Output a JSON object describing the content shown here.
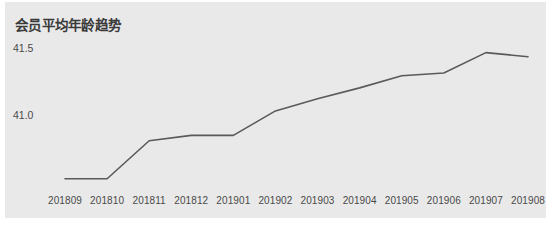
{
  "card": {
    "title": "会员平均年龄趋势",
    "background_color": "#e9e9e9",
    "page_background_color": "#ffffff"
  },
  "chart_data": {
    "type": "line",
    "title": "会员平均年龄趋势",
    "xlabel": "",
    "ylabel": "",
    "x": [
      "201809",
      "201810",
      "201811",
      "201812",
      "201901",
      "201902",
      "201903",
      "201904",
      "201905",
      "201906",
      "201907",
      "201908"
    ],
    "categories": [
      "201809",
      "201810",
      "201811",
      "201812",
      "201901",
      "201902",
      "201903",
      "201904",
      "201905",
      "201906",
      "201907",
      "201908"
    ],
    "values": [
      40.54,
      40.54,
      40.82,
      40.86,
      40.86,
      41.04,
      41.13,
      41.21,
      41.3,
      41.32,
      41.47,
      41.44
    ],
    "series": [
      {
        "name": "会员平均年龄",
        "values": [
          40.54,
          40.54,
          40.82,
          40.86,
          40.86,
          41.04,
          41.13,
          41.21,
          41.3,
          41.32,
          41.47,
          41.44
        ],
        "color": "#5a5a5a"
      }
    ],
    "ytick_labels": [
      "41.5",
      "41.0"
    ],
    "ytick_values": [
      41.5,
      41.0
    ],
    "ylim": [
      40.42,
      41.6
    ],
    "grid": false,
    "legend": false,
    "legend_position": "none",
    "line_color": "#5a5a5a",
    "line_width": 1.6,
    "markers": false
  },
  "axis": {
    "y_ticks": [
      {
        "label": "41.5",
        "value": 41.5
      },
      {
        "label": "41.0",
        "value": 41.0
      }
    ],
    "x_ticks": [
      {
        "label": "201809"
      },
      {
        "label": "201810"
      },
      {
        "label": "201811"
      },
      {
        "label": "201812"
      },
      {
        "label": "201901"
      },
      {
        "label": "201902"
      },
      {
        "label": "201903"
      },
      {
        "label": "201904"
      },
      {
        "label": "201905"
      },
      {
        "label": "201906"
      },
      {
        "label": "201907"
      },
      {
        "label": "201908"
      }
    ]
  }
}
